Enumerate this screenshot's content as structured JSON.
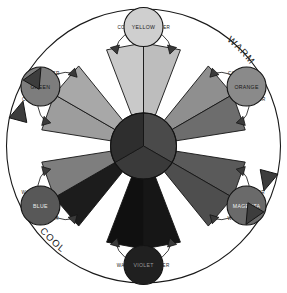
{
  "diagram": {
    "outer_labels": {
      "warm": "WARM",
      "cool": "COOL"
    },
    "modifier_labels": {
      "cooler": "COOLER",
      "warmer": "WARMER"
    },
    "colors": {
      "page_background": "#ffffff",
      "outline": "#1a1a1a",
      "hub_light": "#4a4a4a",
      "hub_mid": "#3a3a3a",
      "hub_dark": "#2e2e2e"
    },
    "hues": [
      {
        "name": "YELLOW",
        "angle": 270,
        "swatch": "#cfcfcf",
        "text_color": "#222222",
        "wedge_cool": "#c9c9c9",
        "wedge_warm": "#bdbdbd",
        "cooler_side": "left",
        "warmer_side": "right"
      },
      {
        "name": "ORANGE",
        "angle": 330,
        "swatch": "#8a8a8a",
        "text_color": "#151515",
        "wedge_cool": "#8f8f8f",
        "wedge_warm": "#6d6d6d",
        "cooler_side": "below",
        "warmer_side": "above"
      },
      {
        "name": "MAGENTA",
        "angle": 30,
        "swatch": "#6a6a6a",
        "text_color": "#f2f2f2",
        "wedge_cool": "#5a5a5a",
        "wedge_warm": "#4e4e4e",
        "cooler_side": "below",
        "warmer_side": "above"
      },
      {
        "name": "VIOLET",
        "angle": 90,
        "swatch": "#202020",
        "text_color": "#9a9a9a",
        "wedge_cool": "#161616",
        "wedge_warm": "#101010",
        "cooler_side": "left",
        "warmer_side": "right"
      },
      {
        "name": "BLUE",
        "angle": 150,
        "swatch": "#585858",
        "text_color": "#ededed",
        "wedge_cool": "#1c1c1c",
        "wedge_warm": "#7e7e7e",
        "cooler_side": "below",
        "warmer_side": "above"
      },
      {
        "name": "GREEN",
        "angle": 210,
        "swatch": "#7d7d7d",
        "text_color": "#141414",
        "wedge_cool": "#9d9d9d",
        "wedge_warm": "#a8a8a8",
        "cooler_side": "below",
        "warmer_side": "above"
      }
    ],
    "hub_segments": 3,
    "wedge_count": 12,
    "direction_arrows": {
      "count": 4,
      "upper_left": 2,
      "lower_right": 2
    }
  }
}
